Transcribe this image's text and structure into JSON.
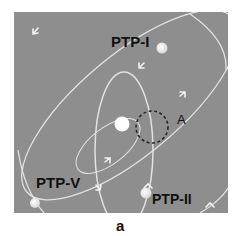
{
  "figure": {
    "panel_label": "a",
    "background_color": "#8e8e8e",
    "orbit_color": "#e6e6e6",
    "labels": {
      "ptp1": "PTP-I",
      "ptp2": "PTP-II",
      "ptp5": "PTP-V",
      "region_a": "A"
    },
    "bodies": [
      {
        "name": "central-body",
        "label": ""
      },
      {
        "name": "ptp-i-body",
        "label": "PTP-I"
      },
      {
        "name": "ptp-ii-body",
        "label": "PTP-II"
      },
      {
        "name": "ptp-v-body",
        "label": "PTP-V"
      }
    ],
    "highlight_region": {
      "label": "A",
      "style": "dashed circle"
    }
  }
}
